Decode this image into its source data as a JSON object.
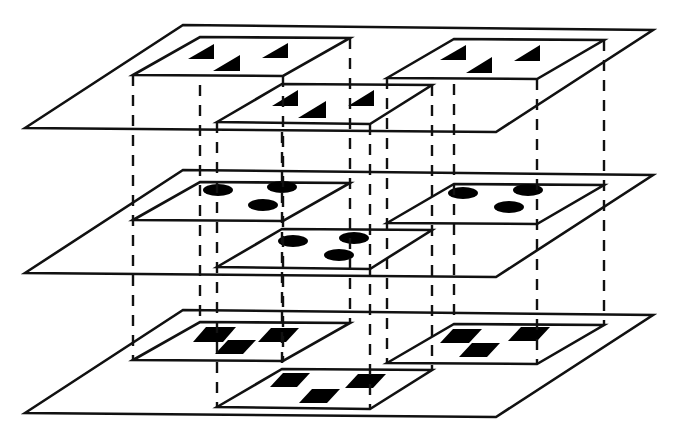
{
  "diagram": {
    "colors": {
      "line": "#111111",
      "fill": "#000000",
      "background": "#ffffff"
    },
    "layer_offsets_y": [
      0,
      145,
      285
    ],
    "outer_plane": {
      "points": [
        [
          25,
          128
        ],
        [
          183,
          25
        ],
        [
          653,
          30
        ],
        [
          496,
          132
        ]
      ]
    },
    "inner_squares": [
      {
        "id": "A",
        "points": [
          [
            133,
            75
          ],
          [
            200,
            37
          ],
          [
            350,
            38
          ],
          [
            283,
            76
          ]
        ]
      },
      {
        "id": "B",
        "points": [
          [
            387,
            78
          ],
          [
            454,
            39
          ],
          [
            604,
            40
          ],
          [
            537,
            79
          ]
        ]
      },
      {
        "id": "C",
        "points": [
          [
            217,
            122
          ],
          [
            282,
            84
          ],
          [
            432,
            85
          ],
          [
            370,
            124
          ]
        ]
      }
    ],
    "layers": [
      {
        "name": "top-layer",
        "glyph_type": "triangle",
        "glyphs": {
          "A": [
            [
              188,
              59
            ],
            [
              214,
              44
            ],
            [
              214,
              59
            ],
            [
              213,
              71
            ],
            [
              240,
              55
            ],
            [
              240,
              71
            ],
            [
              262,
              58
            ],
            [
              288,
              43
            ],
            [
              288,
              58
            ]
          ],
          "B": [
            [
              440,
              60
            ],
            [
              466,
              45
            ],
            [
              466,
              60
            ],
            [
              466,
              73
            ],
            [
              492,
              57
            ],
            [
              492,
              73
            ],
            [
              514,
              61
            ],
            [
              540,
              45
            ],
            [
              540,
              61
            ]
          ],
          "C": [
            [
              272,
              106
            ],
            [
              298,
              90
            ],
            [
              298,
              106
            ],
            [
              298,
              118
            ],
            [
              326,
              101
            ],
            [
              326,
              118
            ],
            [
              348,
              106
            ],
            [
              374,
              90
            ],
            [
              374,
              106
            ]
          ]
        }
      },
      {
        "name": "middle-layer",
        "glyph_type": "ellipse",
        "glyphs": {
          "A": [
            [
              218,
              190,
              15,
              6
            ],
            [
              282,
              187,
              15,
              6
            ],
            [
              263,
              205,
              15,
              6
            ]
          ],
          "B": [
            [
              463,
              193,
              15,
              6
            ],
            [
              528,
              190,
              15,
              6
            ],
            [
              509,
              207,
              15,
              6
            ]
          ],
          "C": [
            [
              293,
              241,
              15,
              6
            ],
            [
              354,
              238,
              15,
              6
            ],
            [
              339,
              255,
              15,
              6
            ]
          ]
        }
      },
      {
        "name": "bottom-layer",
        "glyph_type": "parallelogram",
        "glyphs": {
          "A": [
            [
              [
                193,
                342
              ],
              [
                206,
                327
              ],
              [
                236,
                327
              ],
              [
                223,
                342
              ]
            ],
            [
              [
                215,
                354
              ],
              [
                228,
                340
              ],
              [
                256,
                340
              ],
              [
                243,
                354
              ]
            ],
            [
              [
                258,
                342
              ],
              [
                271,
                328
              ],
              [
                299,
                328
              ],
              [
                286,
                342
              ]
            ]
          ],
          "B": [
            [
              [
                440,
                343
              ],
              [
                453,
                329
              ],
              [
                482,
                329
              ],
              [
                469,
                343
              ]
            ],
            [
              [
                459,
                357
              ],
              [
                472,
                343
              ],
              [
                500,
                343
              ],
              [
                487,
                357
              ]
            ],
            [
              [
                508,
                341
              ],
              [
                521,
                327
              ],
              [
                550,
                327
              ],
              [
                537,
                341
              ]
            ]
          ],
          "C": [
            [
              [
                270,
                387
              ],
              [
                283,
                373
              ],
              [
                310,
                373
              ],
              [
                297,
                387
              ]
            ],
            [
              [
                299,
                403
              ],
              [
                312,
                389
              ],
              [
                340,
                389
              ],
              [
                327,
                403
              ]
            ],
            [
              [
                345,
                388
              ],
              [
                358,
                374
              ],
              [
                386,
                374
              ],
              [
                373,
                388
              ]
            ]
          ]
        }
      }
    ],
    "connectors": {
      "style": "dashed",
      "x_positions": [
        {
          "x": 133,
          "y1": 75,
          "y2": 360
        },
        {
          "x": 200,
          "y1": 85,
          "y2": 322
        },
        {
          "x": 350,
          "y1": 38,
          "y2": 323
        },
        {
          "x": 283,
          "y1": 76,
          "y2": 361
        },
        {
          "x": 387,
          "y1": 78,
          "y2": 363
        },
        {
          "x": 454,
          "y1": 84,
          "y2": 324
        },
        {
          "x": 604,
          "y1": 40,
          "y2": 325
        },
        {
          "x": 537,
          "y1": 79,
          "y2": 364
        },
        {
          "x": 217,
          "y1": 122,
          "y2": 407
        },
        {
          "x": 282,
          "y1": 132,
          "y2": 369
        },
        {
          "x": 432,
          "y1": 85,
          "y2": 370
        },
        {
          "x": 370,
          "y1": 124,
          "y2": 409
        }
      ]
    }
  }
}
